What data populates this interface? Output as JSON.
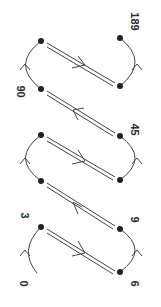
{
  "diagram": {
    "type": "state-transition-path",
    "orientation": "rotated-90-clockwise",
    "colors": {
      "stroke": "#444444",
      "dot": "#222222",
      "text": "#2a2a2a"
    },
    "labels": [
      {
        "id": "0",
        "text": "0"
      },
      {
        "id": "3",
        "text": "3"
      },
      {
        "id": "6",
        "text": "6"
      },
      {
        "id": "9",
        "text": "9"
      },
      {
        "id": "45",
        "text": "45"
      },
      {
        "id": "90",
        "text": "90"
      },
      {
        "id": "189",
        "text": "189"
      }
    ],
    "nodes": [
      {
        "id": "L1",
        "x": 41,
        "y": 41
      },
      {
        "id": "L2",
        "x": 41,
        "y": 89
      },
      {
        "id": "L3",
        "x": 41,
        "y": 135
      },
      {
        "id": "L4",
        "x": 41,
        "y": 181
      },
      {
        "id": "L5",
        "x": 41,
        "y": 227
      },
      {
        "id": "R1",
        "x": 120,
        "y": 38
      },
      {
        "id": "R2",
        "x": 120,
        "y": 86
      },
      {
        "id": "R3",
        "x": 120,
        "y": 136
      },
      {
        "id": "R4",
        "x": 120,
        "y": 180
      },
      {
        "id": "R5",
        "x": 120,
        "y": 229
      },
      {
        "id": "R6",
        "x": 120,
        "y": 272
      }
    ],
    "edges": [
      {
        "type": "double-line",
        "from": "L5",
        "to": "R6",
        "arrow": "down-right"
      },
      {
        "type": "arc",
        "from": "R6",
        "to": "R5",
        "side": "right",
        "arrow": "up"
      },
      {
        "type": "double-line",
        "from": "R5",
        "to": "L4",
        "arrow": "up-left"
      },
      {
        "type": "arc",
        "from": "L4",
        "to": "L3",
        "side": "left",
        "arrow": "up"
      },
      {
        "type": "double-line",
        "from": "L3",
        "to": "R4",
        "arrow": "down-right"
      },
      {
        "type": "arc",
        "from": "R4",
        "to": "R3",
        "side": "right",
        "arrow": "up"
      },
      {
        "type": "double-line",
        "from": "R3",
        "to": "L2",
        "arrow": "up-left"
      },
      {
        "type": "arc",
        "from": "L2",
        "to": "L1",
        "side": "left",
        "arrow": "up"
      },
      {
        "type": "double-line",
        "from": "L1",
        "to": "R2",
        "arrow": "down-right"
      },
      {
        "type": "arc",
        "from": "R2",
        "to": "R1",
        "side": "right",
        "arrow": "up"
      },
      {
        "type": "arc-start",
        "from": "start-0",
        "to": "L5",
        "side": "left",
        "arrow": "up"
      }
    ]
  }
}
